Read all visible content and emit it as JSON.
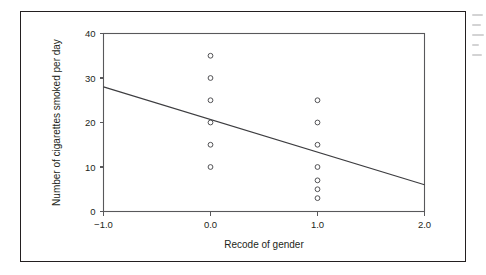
{
  "figure": {
    "border_color": "#231f20",
    "background_color": "#ffffff",
    "axis_color": "#58585b",
    "marker_color": "#4a4a4d",
    "line_color": "#3d3d40"
  },
  "chart_data": {
    "type": "scatter",
    "title": "",
    "xlabel": "Recode of gender",
    "ylabel": "Number of cigarettes smoked per day",
    "xlim": [
      -1.0,
      2.0
    ],
    "ylim": [
      0,
      40
    ],
    "xticks": [
      -1.0,
      0.0,
      1.0,
      2.0
    ],
    "xtick_labels": [
      "-1.0",
      "0.0",
      "1.0",
      "2.0"
    ],
    "yticks": [
      0,
      10,
      20,
      30,
      40
    ],
    "ytick_labels": [
      "0",
      "10",
      "20",
      "30",
      "40"
    ],
    "grid": false,
    "legend": false,
    "marker_style": "open-circle",
    "series": [
      {
        "name": "Observations",
        "points": [
          {
            "x": 0.0,
            "y": 35
          },
          {
            "x": 0.0,
            "y": 30
          },
          {
            "x": 0.0,
            "y": 25
          },
          {
            "x": 0.0,
            "y": 20
          },
          {
            "x": 0.0,
            "y": 15
          },
          {
            "x": 0.0,
            "y": 10
          },
          {
            "x": 1.0,
            "y": 25
          },
          {
            "x": 1.0,
            "y": 20
          },
          {
            "x": 1.0,
            "y": 15
          },
          {
            "x": 1.0,
            "y": 10
          },
          {
            "x": 1.0,
            "y": 7
          },
          {
            "x": 1.0,
            "y": 5
          },
          {
            "x": 1.0,
            "y": 3
          }
        ]
      }
    ],
    "fit_line": {
      "name": "Regression line",
      "x_start": -1.0,
      "y_start": 28,
      "x_end": 2.0,
      "y_end": 6
    }
  }
}
